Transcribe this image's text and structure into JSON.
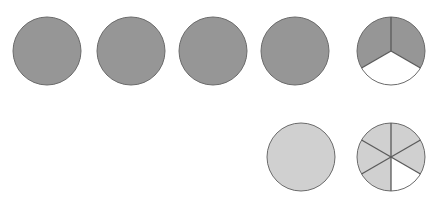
{
  "diagram": {
    "kind": "fraction-circle-model",
    "canvas": {
      "width": 442,
      "height": 203,
      "background": "#ffffff"
    },
    "palette": {
      "dark_fill": "#969696",
      "light_fill": "#d0d0d0",
      "empty_fill": "#ffffff",
      "stroke": "#6b6b6b",
      "divider_stroke": "#5a5a5a"
    },
    "rows": [
      {
        "name": "top-row",
        "label": "",
        "fill": "#969696",
        "whole_count": 4,
        "fraction_numerator": 2,
        "fraction_denominator": 3,
        "value_text": "4 2/3",
        "figures": [
          {
            "name": "top-circle-1",
            "kind": "whole-circle",
            "cx": 47,
            "cy": 51,
            "r": 35,
            "shaded_sectors": 1,
            "total_sectors": 1,
            "fraction_text": "1"
          },
          {
            "name": "top-circle-2",
            "kind": "whole-circle",
            "cx": 131,
            "cy": 51,
            "r": 35,
            "shaded_sectors": 1,
            "total_sectors": 1,
            "fraction_text": "1"
          },
          {
            "name": "top-circle-3",
            "kind": "whole-circle",
            "cx": 213,
            "cy": 51,
            "r": 35,
            "shaded_sectors": 1,
            "total_sectors": 1,
            "fraction_text": "1"
          },
          {
            "name": "top-circle-4",
            "kind": "whole-circle",
            "cx": 295,
            "cy": 51,
            "r": 35,
            "shaded_sectors": 1,
            "total_sectors": 1,
            "fraction_text": "1"
          },
          {
            "name": "top-circle-5",
            "kind": "partitioned-circle",
            "cx": 391,
            "cy": 51,
            "r": 35,
            "shaded_sectors": 2,
            "total_sectors": 3,
            "fraction_text": "2/3"
          }
        ]
      },
      {
        "name": "bottom-row",
        "label": "",
        "fill": "#d0d0d0",
        "whole_count": 1,
        "fraction_numerator": 5,
        "fraction_denominator": 6,
        "value_text": "1 5/6",
        "figures": [
          {
            "name": "bottom-circle-1",
            "kind": "whole-circle",
            "cx": 301,
            "cy": 157,
            "r": 35,
            "shaded_sectors": 1,
            "total_sectors": 1,
            "fraction_text": "1"
          },
          {
            "name": "bottom-circle-2",
            "kind": "partitioned-circle",
            "cx": 391,
            "cy": 157,
            "r": 35,
            "shaded_sectors": 5,
            "total_sectors": 6,
            "fraction_text": "5/6"
          }
        ]
      }
    ]
  }
}
